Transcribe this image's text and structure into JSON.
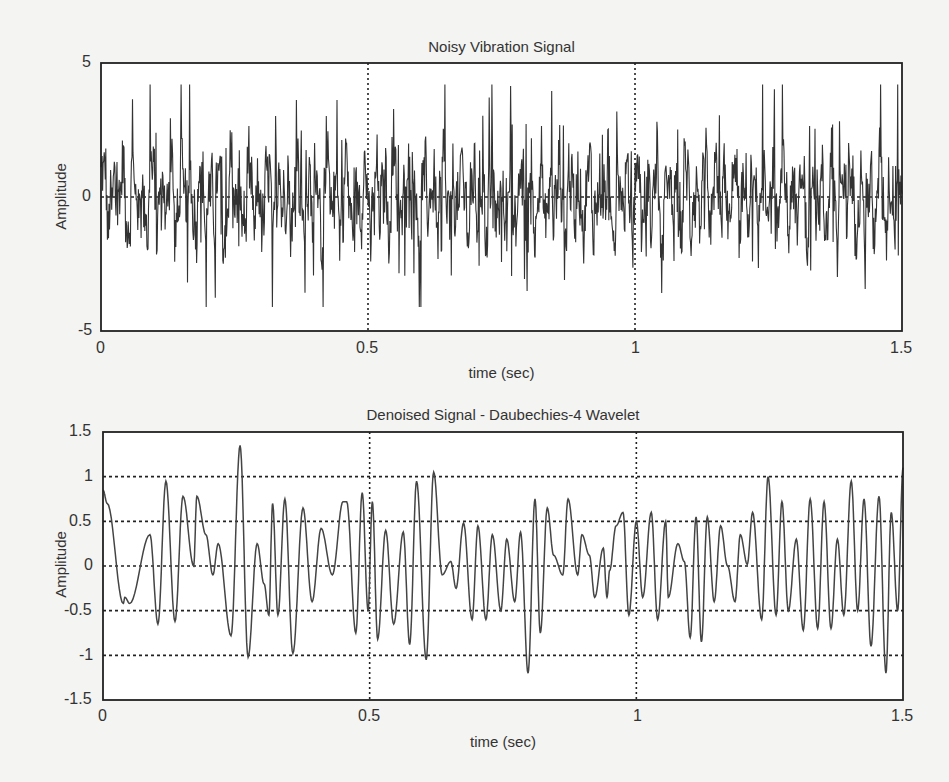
{
  "chart_data": [
    {
      "type": "line",
      "title": "Noisy Vibration Signal",
      "xlabel": "time  (sec)",
      "ylabel": "Amplitude",
      "xlim": [
        0,
        1.5
      ],
      "ylim": [
        -5,
        5
      ],
      "xticks": [
        "0",
        "0.5",
        "1",
        "1.5"
      ],
      "yticks": [
        "5",
        "0",
        "-5"
      ],
      "grid": "dotted vertical lines at x=0.5, x=1; dashed horizontal at y=0",
      "description": "Dense high-frequency noisy signal, approximately 1500 samples, mostly between -3 and +3.5, peaks up to ~4.2 and troughs down to ~-4.1",
      "approx_range": [
        -4.1,
        4.2
      ],
      "samples": 1500
    },
    {
      "type": "line",
      "title": "Denoised Signal - Daubechies-4 Wavelet",
      "xlabel": "time  (sec)",
      "ylabel": "Amplitude",
      "xlim": [
        0,
        1.5
      ],
      "ylim": [
        -1.5,
        1.5
      ],
      "xticks": [
        "0",
        "0.5",
        "1",
        "1.5"
      ],
      "yticks": [
        "1.5",
        "1",
        "0.5",
        "0",
        "-0.5",
        "-1",
        "-1.5"
      ],
      "grid": "dotted grid lines",
      "x": [
        0,
        0.008,
        0.038,
        0.041,
        0.05,
        0.088,
        0.103,
        0.118,
        0.135,
        0.15,
        0.17,
        0.176,
        0.193,
        0.206,
        0.216,
        0.24,
        0.257,
        0.272,
        0.289,
        0.302,
        0.311,
        0.318,
        0.328,
        0.341,
        0.356,
        0.375,
        0.392,
        0.409,
        0.43,
        0.45,
        0.457,
        0.474,
        0.486,
        0.497,
        0.505,
        0.515,
        0.53,
        0.545,
        0.563,
        0.575,
        0.588,
        0.606,
        0.62,
        0.636,
        0.652,
        0.662,
        0.676,
        0.692,
        0.703,
        0.718,
        0.73,
        0.746,
        0.757,
        0.772,
        0.783,
        0.797,
        0.81,
        0.82,
        0.833,
        0.845,
        0.862,
        0.872,
        0.89,
        0.898,
        0.912,
        0.922,
        0.938,
        0.945,
        0.95,
        0.962,
        0.975,
        0.986,
        1.0,
        1.012,
        1.028,
        1.04,
        1.055,
        1.06,
        1.078,
        1.09,
        1.101,
        1.112,
        1.122,
        1.133,
        1.146,
        1.158,
        1.171,
        1.185,
        1.195,
        1.208,
        1.218,
        1.235,
        1.247,
        1.262,
        1.273,
        1.285,
        1.3,
        1.313,
        1.326,
        1.34,
        1.352,
        1.365,
        1.377,
        1.389,
        1.403,
        1.415,
        1.427,
        1.44,
        1.455,
        1.468,
        1.478,
        1.49,
        1.5
      ],
      "y": [
        0.85,
        0.7,
        -0.42,
        -0.35,
        -0.42,
        0.35,
        -0.65,
        0.95,
        -0.62,
        0.78,
        0.0,
        0.78,
        0.35,
        -0.1,
        0.25,
        -0.78,
        1.35,
        -1.02,
        0.25,
        -0.2,
        -0.55,
        0.7,
        -0.55,
        0.75,
        -0.98,
        0.65,
        -0.4,
        0.42,
        -0.1,
        0.72,
        0.72,
        -0.75,
        0.82,
        -0.5,
        0.72,
        -0.82,
        0.4,
        -0.65,
        0.38,
        -0.88,
        0.95,
        -1.05,
        1.05,
        -0.1,
        0.05,
        -0.25,
        0.48,
        -0.6,
        0.45,
        -0.6,
        0.35,
        -0.5,
        0.3,
        -0.4,
        0.38,
        -1.2,
        0.75,
        -0.75,
        0.65,
        0.12,
        -0.1,
        0.75,
        -0.1,
        0.35,
        0.12,
        -0.35,
        0.2,
        -0.35,
        -0.05,
        0.45,
        0.6,
        -0.55,
        0.5,
        -0.35,
        0.6,
        -0.6,
        0.5,
        -0.35,
        0.25,
        0.05,
        -0.8,
        0.55,
        -0.85,
        0.55,
        -0.4,
        0.45,
        0.0,
        -0.4,
        0.35,
        0.02,
        0.6,
        -0.6,
        1.0,
        -0.55,
        0.72,
        -0.5,
        0.3,
        -0.72,
        0.75,
        -0.7,
        0.72,
        -0.7,
        0.3,
        -0.55,
        0.95,
        -0.5,
        0.75,
        -0.9,
        0.78,
        -1.2,
        0.6,
        -0.5,
        1.1
      ]
    }
  ],
  "plots": {
    "top": {
      "title": "Noisy Vibration Signal",
      "xlabel": "time  (sec)",
      "ylabel": "Amplitude",
      "xticks": [
        "0",
        "0.5",
        "1",
        "1.5"
      ],
      "yticks": [
        "5",
        "0",
        "-5"
      ]
    },
    "bottom": {
      "title": "Denoised Signal - Daubechies-4 Wavelet",
      "xlabel": "time  (sec)",
      "ylabel": "Amplitude",
      "xticks": [
        "0",
        "0.5",
        "1",
        "1.5"
      ],
      "yticks": [
        "1.5",
        "1",
        "0.5",
        "0",
        "-0.5",
        "-1",
        "-1.5"
      ]
    }
  },
  "colors": {
    "line": "#333333",
    "axes": "#222222",
    "grid": "#222222",
    "background": "#f4f4f2",
    "plot_bg": "#ffffff"
  }
}
